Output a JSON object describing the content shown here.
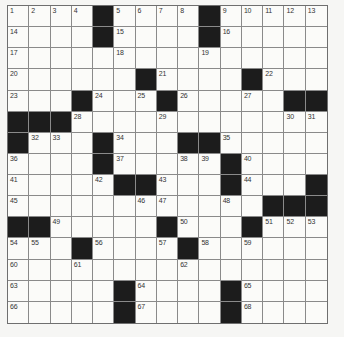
{
  "puzzle": {
    "rows": 15,
    "cols": 15,
    "colors": {
      "block": "#1c1c1c",
      "cell": "#fbfbf9",
      "grid_line": "#8a8a8a",
      "background": "#f6f6f4"
    },
    "grid": [
      [
        "1",
        "2",
        "3",
        "4",
        "#",
        "5",
        "6",
        "7",
        "8",
        "#",
        "9",
        "10",
        "11",
        "12",
        "13"
      ],
      [
        "14",
        "",
        "",
        "",
        "#",
        "15",
        "",
        "",
        "",
        "#",
        "16",
        "",
        "",
        "",
        ""
      ],
      [
        "17",
        "",
        "",
        "",
        "",
        "18",
        "",
        "",
        "",
        "19",
        "",
        "",
        "",
        "",
        ""
      ],
      [
        "20",
        "",
        "",
        "",
        "",
        "",
        "#",
        "21",
        "",
        "",
        "",
        "#",
        "22",
        "",
        ""
      ],
      [
        "23",
        "",
        "",
        "#",
        "24",
        "",
        "25",
        "#",
        "26",
        "",
        "",
        "27",
        "",
        "#",
        "#"
      ],
      [
        "#",
        "#",
        "#",
        "28",
        "",
        "",
        "",
        "29",
        "",
        "",
        "",
        "",
        "",
        "30",
        "31"
      ],
      [
        "#",
        "32",
        "33",
        "",
        "#",
        "34",
        "",
        "",
        "#",
        "#",
        "35",
        "",
        "",
        "",
        ""
      ],
      [
        "36",
        "",
        "",
        "",
        "#",
        "37",
        "",
        "",
        "38",
        "39",
        "#",
        "40",
        "",
        "",
        ""
      ],
      [
        "41",
        "",
        "",
        "",
        "42",
        "#",
        "#",
        "43",
        "",
        "",
        "#",
        "44",
        "",
        "",
        "#"
      ],
      [
        "45",
        "",
        "",
        "",
        "",
        "",
        "46",
        "47",
        "",
        "",
        "48",
        "",
        "#",
        "#",
        "#"
      ],
      [
        "#",
        "#",
        "49",
        "",
        "",
        "",
        "",
        "#",
        "50",
        "",
        "",
        "#",
        "51",
        "52",
        "53"
      ],
      [
        "54",
        "55",
        "",
        "#",
        "56",
        "",
        "",
        "57",
        "#",
        "58",
        "",
        "59",
        "",
        "",
        ""
      ],
      [
        "60",
        "",
        "",
        "61",
        "",
        "",
        "",
        "",
        "62",
        "",
        "",
        "",
        "",
        "",
        ""
      ],
      [
        "63",
        "",
        "",
        "",
        "",
        "#",
        "64",
        "",
        "",
        "",
        "#",
        "65",
        "",
        "",
        ""
      ],
      [
        "66",
        "",
        "",
        "",
        "",
        "#",
        "67",
        "",
        "",
        "",
        "#",
        "68",
        "",
        "",
        ""
      ]
    ]
  }
}
